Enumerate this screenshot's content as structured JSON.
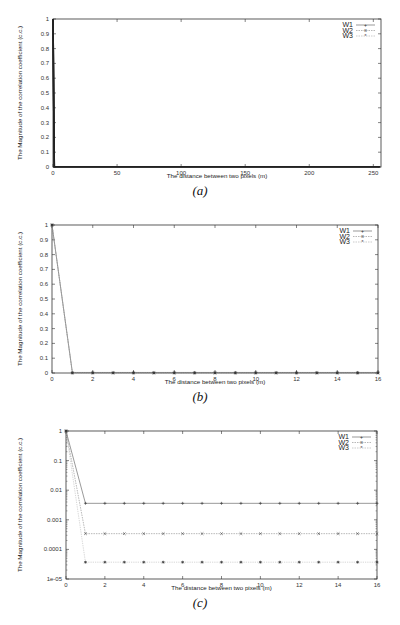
{
  "chart_data": [
    {
      "id": "a",
      "type": "line",
      "caption": "(a)",
      "xlabel": "The distance between two pixels (m)",
      "ylabel": "The Magnitude of the correlation coefficient (c.c.)",
      "xlim": [
        0,
        256
      ],
      "ylim": [
        0,
        1
      ],
      "yscale": "linear",
      "xticks": [
        "0",
        "50",
        "100",
        "150",
        "200",
        "250"
      ],
      "yticks": [
        "0",
        "0.1",
        "0.2",
        "0.3",
        "0.4",
        "0.5",
        "0.6",
        "0.7",
        "0.8",
        "0.9",
        "1"
      ],
      "legend": [
        "W1",
        "W2",
        "W3"
      ],
      "legend_position": "upper right",
      "grid": false,
      "series": [
        {
          "name": "W1",
          "x_note": "0..255",
          "values_note": "1 at x=0, ~0 for x>=1"
        },
        {
          "name": "W2",
          "x_note": "0..255",
          "values_note": "1 at x=0, ~0 for x>=1"
        },
        {
          "name": "W3",
          "x_note": "0..255",
          "values_note": "1 at x=0, ~0 for x>=1"
        }
      ]
    },
    {
      "id": "b",
      "type": "line",
      "caption": "(b)",
      "xlabel": "The distance between two pixels (m)",
      "ylabel": "The Magnitude of the correlation coefficient (c.c.)",
      "xlim": [
        0,
        16
      ],
      "ylim": [
        0,
        1
      ],
      "yscale": "linear",
      "xticks": [
        "0",
        "2",
        "4",
        "6",
        "8",
        "10",
        "12",
        "14",
        "16"
      ],
      "yticks": [
        "0",
        "0.1",
        "0.2",
        "0.3",
        "0.4",
        "0.5",
        "0.6",
        "0.7",
        "0.8",
        "0.9",
        "1"
      ],
      "legend": [
        "W1",
        "W2",
        "W3"
      ],
      "legend_position": "upper right",
      "grid": false,
      "x": [
        0,
        1,
        2,
        3,
        4,
        5,
        6,
        7,
        8,
        9,
        10,
        11,
        12,
        13,
        14,
        15,
        16
      ],
      "series": [
        {
          "name": "W1",
          "values": [
            1,
            0.0036,
            0.0036,
            0.0036,
            0.0036,
            0.0036,
            0.0036,
            0.0036,
            0.0036,
            0.0036,
            0.0036,
            0.0036,
            0.0036,
            0.0036,
            0.0036,
            0.0036,
            0.0036
          ]
        },
        {
          "name": "W2",
          "values": [
            1,
            0.00034,
            0.00034,
            0.00034,
            0.00034,
            0.00034,
            0.00034,
            0.00034,
            0.00034,
            0.00034,
            0.00034,
            0.00034,
            0.00034,
            0.00034,
            0.00034,
            0.00034,
            0.00034
          ]
        },
        {
          "name": "W3",
          "values": [
            1,
            3.7e-05,
            3.7e-05,
            3.7e-05,
            3.7e-05,
            3.7e-05,
            3.7e-05,
            3.7e-05,
            3.7e-05,
            3.7e-05,
            3.7e-05,
            3.7e-05,
            3.7e-05,
            3.7e-05,
            3.7e-05,
            3.7e-05,
            3.7e-05
          ]
        }
      ]
    },
    {
      "id": "c",
      "type": "line",
      "caption": "(c)",
      "xlabel": "The distance between two pixels (m)",
      "ylabel": "The Magnitude of the correlation coefficient (c.c.)",
      "xlim": [
        0,
        16
      ],
      "ylim": [
        1e-05,
        1
      ],
      "yscale": "log",
      "xticks": [
        "0",
        "2",
        "4",
        "6",
        "8",
        "10",
        "12",
        "14",
        "16"
      ],
      "yticks": [
        "1e-05",
        "0.0001",
        "0.001",
        "0.01",
        "0.1",
        "1"
      ],
      "legend": [
        "W1",
        "W2",
        "W3"
      ],
      "legend_position": "upper right",
      "grid": false,
      "x": [
        0,
        1,
        2,
        3,
        4,
        5,
        6,
        7,
        8,
        9,
        10,
        11,
        12,
        13,
        14,
        15,
        16
      ],
      "series": [
        {
          "name": "W1",
          "values": [
            1,
            0.0036,
            0.0036,
            0.0036,
            0.0036,
            0.0036,
            0.0036,
            0.0036,
            0.0036,
            0.0036,
            0.0036,
            0.0036,
            0.0036,
            0.0036,
            0.0036,
            0.0036,
            0.0036
          ]
        },
        {
          "name": "W2",
          "values": [
            1,
            0.00034,
            0.00034,
            0.00034,
            0.00034,
            0.00034,
            0.00034,
            0.00034,
            0.00034,
            0.00034,
            0.00034,
            0.00034,
            0.00034,
            0.00034,
            0.00034,
            0.00034,
            0.00034
          ]
        },
        {
          "name": "W3",
          "values": [
            1,
            3.7e-05,
            3.7e-05,
            3.7e-05,
            3.7e-05,
            3.7e-05,
            3.7e-05,
            3.7e-05,
            3.7e-05,
            3.7e-05,
            3.7e-05,
            3.7e-05,
            3.7e-05,
            3.7e-05,
            3.7e-05,
            3.7e-05,
            3.7e-05
          ]
        }
      ]
    }
  ],
  "colors": {
    "axis": "#333333",
    "W1": "#555555",
    "W2": "#888888",
    "W3": "#aaaaaa"
  }
}
